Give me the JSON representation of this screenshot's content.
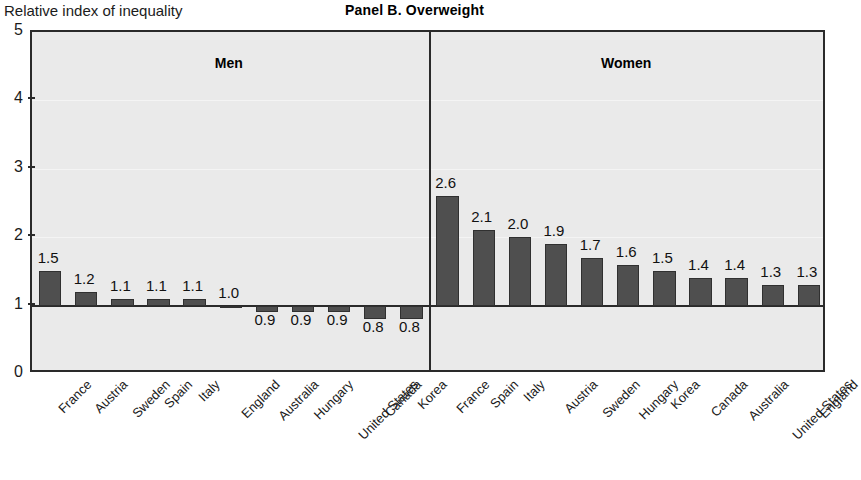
{
  "axis_title": "Relative index of inequality",
  "title": "Panel B. Overweight",
  "groups": [
    {
      "heading": "Men"
    },
    {
      "heading": "Women"
    }
  ],
  "colors": {
    "bar_fill": "#4f4f4f",
    "bar_edge": "#303030",
    "plot_background": "#eaeaea",
    "frame": "#2a2a2a",
    "text": "#1b1b1b"
  },
  "chart_data": {
    "type": "bar",
    "title": "Panel B. Overweight",
    "xlabel": "",
    "ylabel": "Relative index of inequality",
    "ylim": [
      0,
      5
    ],
    "yticks": [
      0,
      1,
      2,
      3,
      4,
      5
    ],
    "baseline": 1,
    "grid": false,
    "legend": "none",
    "panels": [
      {
        "name": "Men",
        "categories": [
          "France",
          "Austria",
          "Sweden",
          "Spain",
          "Italy",
          "England",
          "Australia",
          "Hungary",
          "United States",
          "Canada",
          "Korea"
        ],
        "values": [
          1.5,
          1.2,
          1.1,
          1.1,
          1.1,
          1.0,
          0.9,
          0.9,
          0.9,
          0.8,
          0.8
        ],
        "labels": [
          "1.5",
          "1.2",
          "1.1",
          "1.1",
          "1.1",
          "1.0",
          "0.9",
          "0.9",
          "0.9",
          "0.8",
          "0.8"
        ]
      },
      {
        "name": "Women",
        "categories": [
          "France",
          "Spain",
          "Italy",
          "Austria",
          "Sweden",
          "Hungary",
          "Korea",
          "Canada",
          "Australia",
          "United States",
          "England"
        ],
        "values": [
          2.6,
          2.1,
          2.0,
          1.9,
          1.7,
          1.6,
          1.5,
          1.4,
          1.4,
          1.3,
          1.3
        ],
        "labels": [
          "2.6",
          "2.1",
          "2.0",
          "1.9",
          "1.7",
          "1.6",
          "1.5",
          "1.4",
          "1.4",
          "1.3",
          "1.3"
        ]
      }
    ]
  }
}
